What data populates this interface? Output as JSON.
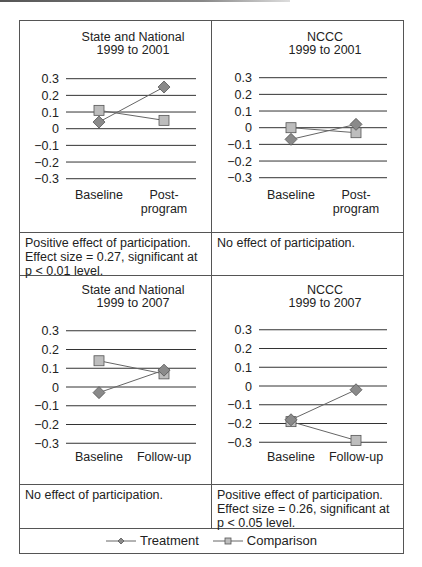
{
  "chart_data": [
    {
      "type": "line",
      "title": "State and National 1999 to 2001",
      "title_lines": [
        "State and National",
        "1999 to 2001"
      ],
      "categories": [
        "Baseline",
        "Post-program"
      ],
      "category_lines": [
        [
          "Baseline"
        ],
        [
          "Post-",
          "program"
        ]
      ],
      "series": [
        {
          "name": "Treatment",
          "marker": "diamond",
          "values": [
            0.04,
            0.25
          ]
        },
        {
          "name": "Comparison",
          "marker": "square",
          "values": [
            0.11,
            0.05
          ]
        }
      ],
      "yticks": [
        "0.3",
        "0.2",
        "0.1",
        "0",
        "−0.1",
        "−0.2",
        "−0.3"
      ],
      "ylim": [
        -0.3,
        0.3
      ],
      "grid": true,
      "xlabel": "",
      "ylabel": ""
    },
    {
      "type": "line",
      "title": "NCCC 1999 to 2001",
      "title_lines": [
        "NCCC",
        "1999 to 2001"
      ],
      "categories": [
        "Baseline",
        "Post-program"
      ],
      "category_lines": [
        [
          "Baseline"
        ],
        [
          "Post-",
          "program"
        ]
      ],
      "series": [
        {
          "name": "Treatment",
          "marker": "diamond",
          "values": [
            -0.07,
            0.02
          ]
        },
        {
          "name": "Comparison",
          "marker": "square",
          "values": [
            0.0,
            -0.03
          ]
        }
      ],
      "yticks": [
        "0.3",
        "0.2",
        "0.1",
        "0",
        "−0.1",
        "−0.2",
        "−0.3"
      ],
      "ylim": [
        -0.3,
        0.3
      ],
      "grid": true,
      "xlabel": "",
      "ylabel": ""
    },
    {
      "type": "line",
      "title": "State and National 1999 to 2007",
      "title_lines": [
        "State and National",
        "1999 to 2007"
      ],
      "categories": [
        "Baseline",
        "Follow-up"
      ],
      "category_lines": [
        [
          "Baseline"
        ],
        [
          "Follow-up"
        ]
      ],
      "series": [
        {
          "name": "Treatment",
          "marker": "diamond",
          "values": [
            -0.03,
            0.09
          ]
        },
        {
          "name": "Comparison",
          "marker": "square",
          "values": [
            0.14,
            0.07
          ]
        }
      ],
      "yticks": [
        "0.3",
        "0.2",
        "0.1",
        "0",
        "−0.1",
        "−0.2",
        "−0.3"
      ],
      "ylim": [
        -0.3,
        0.3
      ],
      "grid": true,
      "xlabel": "",
      "ylabel": ""
    },
    {
      "type": "line",
      "title": "NCCC 1999 to 2007",
      "title_lines": [
        "NCCC",
        "1999 to 2007"
      ],
      "categories": [
        "Baseline",
        "Follow-up"
      ],
      "category_lines": [
        [
          "Baseline"
        ],
        [
          "Follow-up"
        ]
      ],
      "series": [
        {
          "name": "Treatment",
          "marker": "diamond",
          "values": [
            -0.18,
            -0.02
          ]
        },
        {
          "name": "Comparison",
          "marker": "square",
          "values": [
            -0.19,
            -0.29
          ]
        }
      ],
      "yticks": [
        "0.3",
        "0.2",
        "0.1",
        "0",
        "−0.1",
        "−0.2",
        "−0.3"
      ],
      "ylim": [
        -0.3,
        0.3
      ],
      "grid": true,
      "xlabel": "",
      "ylabel": ""
    }
  ],
  "notes": {
    "row1_left": [
      "Positive effect of participation.",
      "Effect size = 0.27, significant at",
      "p < 0.01 level."
    ],
    "row1_right": [
      "No effect of participation."
    ],
    "row2_left": [
      "No effect of participation."
    ],
    "row2_right": [
      "Positive effect of participation.",
      "Effect size = 0.26, significant at",
      "p < 0.05 level."
    ]
  },
  "legend": {
    "position": "bottom",
    "items": [
      {
        "label": "Treatment",
        "marker": "diamond"
      },
      {
        "label": "Comparison",
        "marker": "square"
      }
    ]
  },
  "colors": {
    "gridline": "#333333",
    "border": "#555555",
    "series_line": "#666666",
    "treatment_fill": "#8a8a8a",
    "comparison_fill": "#bdbdbd",
    "marker_stroke": "#555555",
    "text": "#222222"
  }
}
